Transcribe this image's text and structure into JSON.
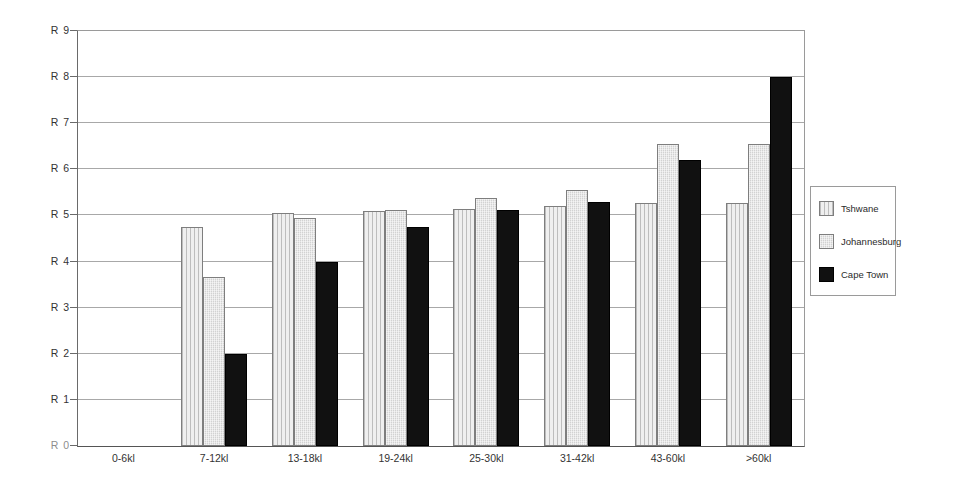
{
  "chart_data": {
    "type": "bar",
    "title": "",
    "subtitle": "",
    "xlabel": "",
    "ylabel": "",
    "categories": [
      "0-6kl",
      "7-12kl",
      "13-18kl",
      "19-24kl",
      "25-30kl",
      "31-42kl",
      "43-60kl",
      ">60kl"
    ],
    "series": [
      {
        "name": "Tshwane",
        "color": "#e3e3e3",
        "pattern": "vertical-lines",
        "values": [
          0,
          4.75,
          5.05,
          5.1,
          5.15,
          5.2,
          5.27,
          5.27
        ]
      },
      {
        "name": "Johannesburg",
        "color": "#d2d2d2",
        "pattern": "fine-dots",
        "values": [
          0,
          3.67,
          4.95,
          5.12,
          5.37,
          5.55,
          6.55,
          6.55
        ]
      },
      {
        "name": "Cape Town",
        "color": "#111111",
        "pattern": "solid",
        "values": [
          0,
          2.0,
          4.0,
          4.75,
          5.12,
          5.3,
          6.2,
          8.0
        ]
      }
    ],
    "ylim": [
      0,
      9
    ],
    "y_ticks": [
      0,
      1,
      2,
      3,
      4,
      5,
      6,
      7,
      8,
      9
    ],
    "y_tick_labels": [
      "R 0",
      "R 1",
      "R 2",
      "R 3",
      "R 4",
      "R 5",
      "R 6",
      "R 7",
      "R 8",
      "R 9"
    ],
    "grid": true,
    "grid_axis": "y",
    "legend_position": "right",
    "legend_entries": [
      "Tshwane",
      "Johannesburg",
      "Cape Town"
    ]
  }
}
